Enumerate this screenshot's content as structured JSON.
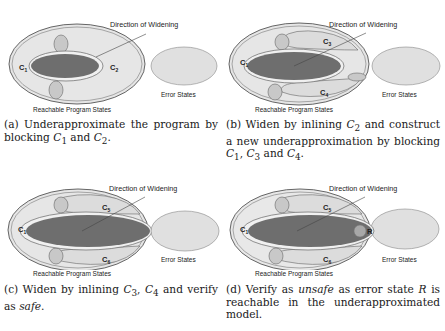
{
  "panels": [
    {
      "id": "a",
      "direction_label": "Direction of Widening",
      "reachable_label": "Reachable Program States",
      "error_label": "Error States",
      "labels": {
        "left": "C",
        "left_sub": "1",
        "right": "C",
        "right_sub": "2"
      },
      "caption": {
        "tag": "(a)",
        "text1": " Underapproximate the program by blocking ",
        "m1": "C",
        "m1s": "1",
        "text2": " and ",
        "m2": "C",
        "m2s": "2",
        "text3": "."
      }
    },
    {
      "id": "b",
      "direction_label": "Direction of Widening",
      "reachable_label": "Reachable Program States",
      "error_label": "Error States",
      "labels": {
        "left": "C",
        "left_sub": "1",
        "top": "C",
        "top_sub": "3",
        "bottom": "C",
        "bottom_sub": "4"
      },
      "caption": {
        "tag": "(b)",
        "text1": " Widen by inlining ",
        "m1": "C",
        "m1s": "2",
        "text2": " and construct a new underapproximation by blocking ",
        "m2": "C",
        "m2s": "1",
        "text3": ", ",
        "m3": "C",
        "m3s": "3",
        "text4": " and ",
        "m4": "C",
        "m4s": "4",
        "text5": "."
      }
    },
    {
      "id": "c",
      "direction_label": "Direction of Widening",
      "reachable_label": "Reachable Program States",
      "error_label": "Error States",
      "labels": {
        "left": "C",
        "left_sub": "1",
        "top": "C",
        "top_sub": "5",
        "bottom": "C",
        "bottom_sub": "6"
      },
      "caption": {
        "tag": "(c)",
        "text1": " Widen by inlining ",
        "m1": "C",
        "m1s": "3",
        "text2": ", ",
        "m2": "C",
        "m2s": "4",
        "text3": " and verify as ",
        "em": "safe",
        "text4": "."
      }
    },
    {
      "id": "d",
      "direction_label": "Direction of Widening",
      "reachable_label": "Reachable Program States",
      "error_label": "Error States",
      "labels": {
        "left": "C",
        "left_sub": "1",
        "top": "C",
        "top_sub": "5",
        "bottom": "C",
        "bottom_sub": "6",
        "error_state": "R"
      },
      "caption": {
        "tag": "(d)",
        "text1": " Verify as ",
        "em": "unsafe",
        "text2": " as error state ",
        "m1": "R",
        "text3": " is reachable in the underapproximated model."
      }
    }
  ],
  "colors": {
    "outer_fill": "#e6e6e6",
    "outer_stroke": "#555555",
    "inner_fill": "#6e6e6e",
    "blob_fill": "#c8c8c8",
    "error_fill": "#e0e0e0",
    "error_state_fill": "#a8a8a8"
  }
}
